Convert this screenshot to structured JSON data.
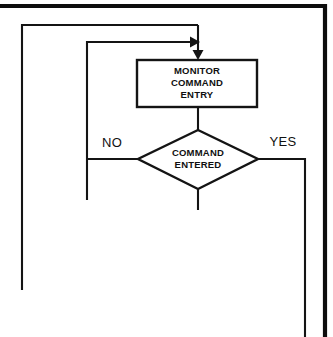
{
  "diagram": {
    "type": "flowchart",
    "background_color": "#ffffff",
    "line_color": "#141414",
    "frame": {
      "name": "page-frame-border",
      "description": "thick printed page border along top and right edges",
      "color": "#0d0d0d",
      "thickness_px": 4.2
    },
    "nodes": [
      {
        "id": "monitor-command-entry",
        "shape": "process",
        "lines": [
          "MONITOR",
          "COMMAND",
          "ENTRY"
        ],
        "text": "MONITOR COMMAND ENTRY",
        "x": 137,
        "y": 60,
        "width": 120,
        "height": 47
      },
      {
        "id": "command-entered",
        "shape": "decision",
        "lines": [
          "COMMAND",
          "ENTERED"
        ],
        "text": "COMMAND ENTERED",
        "cx": 198,
        "cy": 159,
        "half_width": 60,
        "half_height": 30
      }
    ],
    "branch_labels": [
      {
        "id": "no-label",
        "text": "NO",
        "x": 112,
        "y": 144
      },
      {
        "id": "yes-label",
        "text": "YES",
        "x": 283,
        "y": 143
      }
    ],
    "connectors": [
      {
        "id": "entry-arrow-into-process",
        "description": "vertical arrow entering top of MONITOR COMMAND ENTRY box",
        "points": "198,25 198,58",
        "arrow": "down"
      },
      {
        "id": "outer-loop-return",
        "description": "outer loop from bottom-left riser up and across to process entry",
        "points": "22,290 22,25 198,25",
        "arrow": "none"
      },
      {
        "id": "inner-loop-return",
        "description": "inner NO loop from decision left up and across into entry line",
        "points": "87,200 87,42 196,42",
        "arrow": "right"
      },
      {
        "id": "process-to-decision",
        "description": "line from bottom of process box to top of decision diamond",
        "points": "198,107 198,130",
        "arrow": "none"
      },
      {
        "id": "decision-no-branch",
        "description": "NO branch leaving left vertex of diamond to inner loop riser",
        "points": "138,159 87,159",
        "arrow": "none"
      },
      {
        "id": "decision-yes-branch",
        "description": "YES branch leaving right vertex of diamond, turning down off page",
        "points": "258,159 305,159 305,337",
        "arrow": "none"
      },
      {
        "id": "decision-bottom-stub",
        "description": "short stub below diamond bottom vertex",
        "points": "198,189 198,210",
        "arrow": "none"
      }
    ]
  }
}
